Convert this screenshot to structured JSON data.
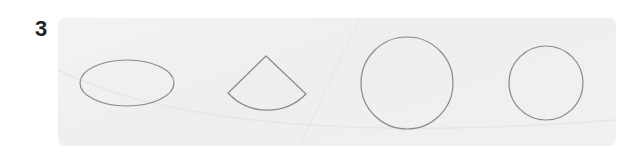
{
  "exercise": {
    "number": "3",
    "shapes": [
      {
        "type": "ellipse",
        "name": "ellipse"
      },
      {
        "type": "sector",
        "name": "circular-sector"
      },
      {
        "type": "circle",
        "name": "large-circle"
      },
      {
        "type": "circle",
        "name": "small-circle"
      }
    ],
    "stroke_color": "#8a8a8a",
    "panel_color": "#f0f0f0"
  }
}
